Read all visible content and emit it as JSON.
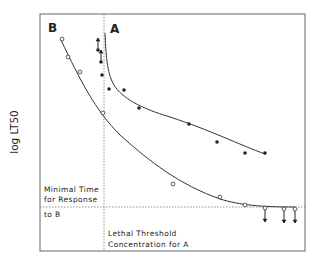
{
  "chart_data": {
    "type": "line",
    "title": "",
    "xlabel": "",
    "ylabel": "log LT50",
    "grid": false,
    "legend": "none (curves labeled inline)",
    "series": [
      {
        "name": "A",
        "marker": "filled-circle",
        "points_px": [
          [
            98,
            50
          ],
          [
            101,
            62
          ],
          [
            102,
            75
          ],
          [
            109,
            89
          ],
          [
            124,
            90
          ],
          [
            139,
            108
          ],
          [
            189,
            124
          ],
          [
            217,
            142
          ],
          [
            245,
            153
          ],
          [
            265,
            153
          ]
        ],
        "upward_arrows_at": [
          [
            98,
            50
          ],
          [
            101,
            62
          ]
        ],
        "curve_px": "M105,33 C106,60 108,75 114,85 C122,98 140,108 170,117 C210,130 240,145 265,154"
      },
      {
        "name": "B",
        "marker": "open-circle",
        "points_px": [
          [
            62,
            39
          ],
          [
            68,
            57
          ],
          [
            80,
            72
          ],
          [
            103,
            113
          ],
          [
            173,
            184
          ],
          [
            220,
            197
          ],
          [
            245,
            205
          ],
          [
            265,
            208
          ],
          [
            284,
            209
          ],
          [
            295,
            209
          ]
        ],
        "downward_arrows_at": [
          [
            265,
            208
          ],
          [
            284,
            209
          ],
          [
            295,
            209
          ]
        ],
        "curve_px": "M61,40 C80,80 95,110 120,135 C150,162 180,185 220,199 C240,205 260,207 295,207"
      }
    ],
    "reference_lines": [
      {
        "orientation": "vertical",
        "label": "Lethal Threshold Concentration for A"
      },
      {
        "orientation": "horizontal",
        "label": "Minimal Time for Response to B"
      }
    ]
  },
  "labels": {
    "curve_a": "A",
    "curve_b": "B",
    "y_axis": "log LT50",
    "min_time_line1": "Minimal Time",
    "min_time_line2": "for Response",
    "min_time_line3": "to B",
    "lethal_line1": "Lethal Threshold",
    "lethal_line2": "Concentration for A"
  }
}
